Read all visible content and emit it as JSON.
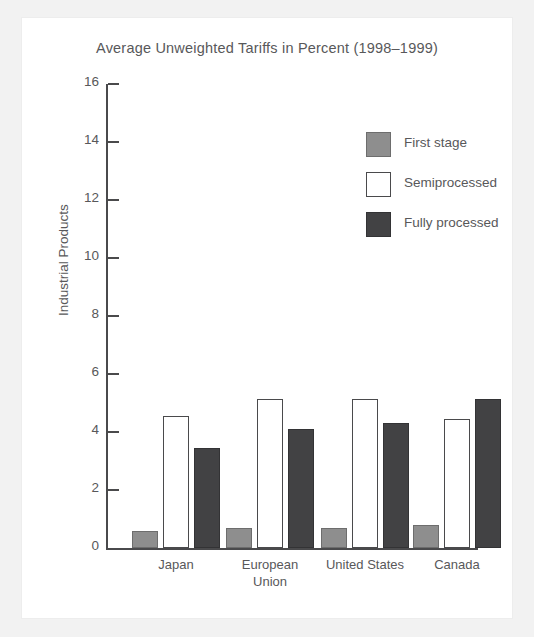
{
  "chart_data": {
    "type": "bar",
    "title": "Average Unweighted Tariffs in Percent (1998–1999)",
    "xlabel": "",
    "ylabel": "Industrial Products",
    "ylim": [
      0,
      16
    ],
    "yticks": [
      0,
      2,
      4,
      6,
      8,
      10,
      12,
      14,
      16
    ],
    "ytick_labels": [
      "0",
      "2",
      "4",
      "6",
      "8",
      "10",
      "12",
      "14",
      "16"
    ],
    "grid": false,
    "legend_position": "upper right",
    "categories": [
      "Japan",
      "European Union",
      "United States",
      "Canada"
    ],
    "category_lines": [
      [
        "Japan"
      ],
      [
        "European",
        "Union"
      ],
      [
        "United States"
      ],
      [
        "Canada"
      ]
    ],
    "series": [
      {
        "name": "First stage",
        "color": "#8e8e8e",
        "values": [
          0.6,
          0.7,
          0.7,
          0.8
        ]
      },
      {
        "name": "Semiprocessed",
        "color": "#ffffff",
        "values": [
          4.55,
          5.15,
          5.15,
          4.45
        ]
      },
      {
        "name": "Fully processed",
        "color": "#424244",
        "values": [
          3.45,
          4.1,
          4.3,
          5.15
        ]
      }
    ]
  },
  "colors": {
    "axis": "#4a4a4c",
    "text": "#58585a",
    "plate": "#ffffff",
    "page": "#f2f2f2",
    "first_stage": "#8e8e8e",
    "semiprocessed": "#ffffff",
    "fully_processed": "#424244"
  }
}
